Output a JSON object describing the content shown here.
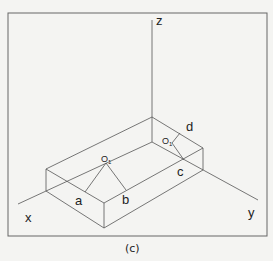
{
  "diagram": {
    "caption": "(c)",
    "axes": {
      "x_label": "x",
      "y_label": "y",
      "z_label": "z"
    },
    "points": {
      "a": "a",
      "b": "b",
      "c": "c",
      "d": "d",
      "o1": "O",
      "o1_sub": "1",
      "o2": "O",
      "o2_sub": "1"
    },
    "colors": {
      "line": "#555555",
      "frame": "#666666",
      "text": "#222222",
      "background": "#f4f4f2"
    }
  }
}
